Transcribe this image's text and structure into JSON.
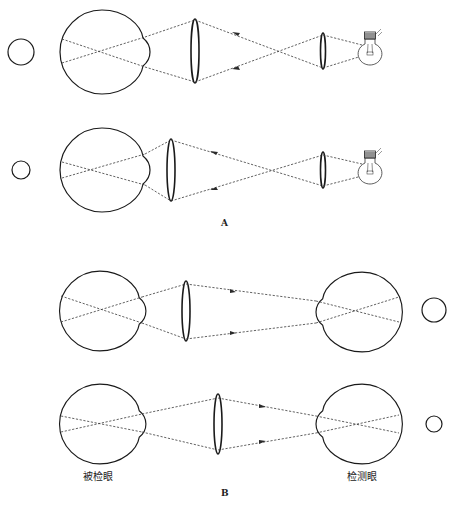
{
  "figure": {
    "panels": [
      {
        "id": "A",
        "label": "A",
        "description": "Retinoscopy schematic: light source through condensing lens and large lens into eye, reflected rays return",
        "rows": [
          {
            "name": "row-a1",
            "pupil_reflex_size": "large",
            "arrow_direction": "toward-eye"
          },
          {
            "name": "row-a2",
            "pupil_reflex_size": "small",
            "arrow_direction": "toward-eye"
          }
        ]
      },
      {
        "id": "B",
        "label": "B",
        "description": "Examined eye and observing eye with intermediate lens; rays travel from examined eye to observer",
        "rows": [
          {
            "name": "row-b1",
            "pupil_reflex_size": "large",
            "arrow_direction": "toward-observer"
          },
          {
            "name": "row-b2",
            "pupil_reflex_size": "small",
            "arrow_direction": "toward-observer"
          }
        ],
        "labels": {
          "examined_eye": "被检眼",
          "observer_eye": "检测眼"
        }
      }
    ],
    "icons": [
      "eye-icon",
      "lens-icon",
      "light-bulb-icon",
      "pupil-reflex-circle-icon",
      "arrow-icon"
    ],
    "colors": {
      "line": "#1a1a1a",
      "ray": "#3a3a3a",
      "background": "#ffffff"
    }
  }
}
